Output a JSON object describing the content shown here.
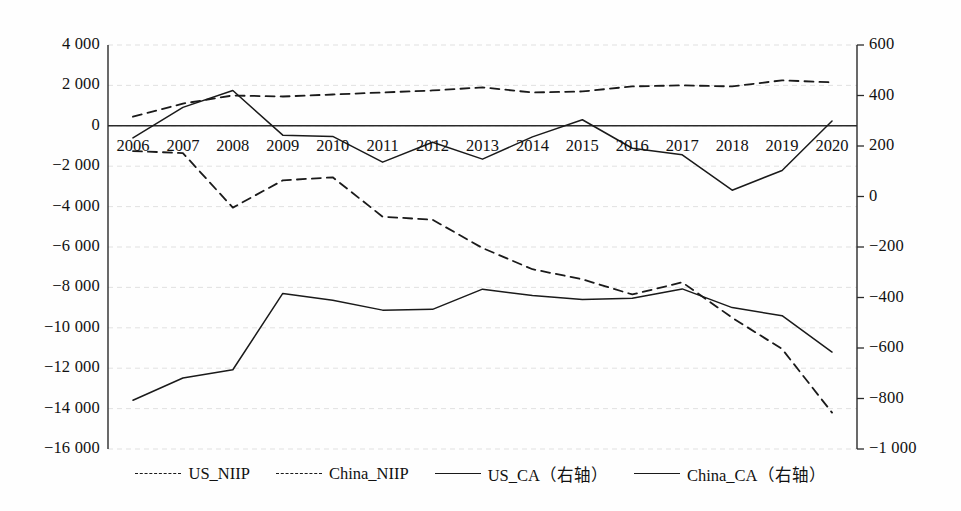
{
  "chart_data": {
    "type": "line",
    "title": "",
    "subtitle": "",
    "xlabel": "",
    "ylabel": "",
    "categories": [
      "2006",
      "2007",
      "2008",
      "2009",
      "2010",
      "2011",
      "2012",
      "2013",
      "2014",
      "2015",
      "2016",
      "2017",
      "2018",
      "2019",
      "2020"
    ],
    "x": [
      2006,
      2007,
      2008,
      2009,
      2010,
      2011,
      2012,
      2013,
      2014,
      2015,
      2016,
      2017,
      2018,
      2019,
      2020
    ],
    "grid": true,
    "legend_position": "bottom",
    "axes": {
      "left": {
        "label": "",
        "ylim": [
          -16000,
          4000
        ],
        "tick_step": 2000,
        "ticks": [
          4000,
          2000,
          0,
          -2000,
          -4000,
          -6000,
          -8000,
          -10000,
          -12000,
          -14000,
          -16000
        ],
        "tick_labels": [
          "4 000",
          "2 000",
          "0",
          "−2 000",
          "−4 000",
          "−6 000",
          "−8 000",
          "−10 000",
          "−12 000",
          "−14 000",
          "−16 000"
        ]
      },
      "right": {
        "label": "右轴",
        "ylim": [
          -1000,
          600
        ],
        "tick_step": 200,
        "ticks": [
          600,
          400,
          200,
          0,
          -200,
          -400,
          -600,
          -800,
          -1000
        ],
        "tick_labels": [
          "600",
          "400",
          "200",
          "0",
          "−200",
          "−400",
          "−600",
          "−800",
          "−1 000"
        ]
      }
    },
    "series": [
      {
        "name": "US_NIIP",
        "axis": "left",
        "style": "dashed",
        "color": "#1a1a1a",
        "values": [
          -1250,
          -1350,
          -4050,
          -2700,
          -2550,
          -4500,
          -4650,
          -6050,
          -7100,
          -7600,
          -8350,
          -7750,
          -9500,
          -11050,
          -14200
        ]
      },
      {
        "name": "China_NIIP",
        "axis": "left",
        "style": "dashed",
        "color": "#1a1a1a",
        "values": [
          450,
          1100,
          1500,
          1450,
          1550,
          1650,
          1750,
          1900,
          1650,
          1700,
          1950,
          2000,
          1950,
          2250,
          2150
        ]
      },
      {
        "name": "US_CA（右轴）",
        "axis": "right",
        "style": "solid",
        "color": "#1a1a1a",
        "values": [
          -807,
          -719,
          -686,
          -384,
          -411,
          -450,
          -447,
          -367,
          -392,
          -408,
          -403,
          -366,
          -440,
          -472,
          -616
        ]
      },
      {
        "name": "China_CA（右轴）",
        "axis": "right",
        "style": "solid",
        "color": "#1a1a1a",
        "values": [
          232,
          353,
          420,
          243,
          238,
          136,
          215,
          148,
          236,
          304,
          191,
          165,
          25,
          103,
          299
        ]
      }
    ]
  },
  "legend": {
    "items": [
      {
        "label": "US_NIIP",
        "style": "dashed"
      },
      {
        "label": "China_NIIP",
        "style": "dashed"
      },
      {
        "label": "US_CA（右轴）",
        "style": "solid"
      },
      {
        "label": "China_CA（右轴）",
        "style": "solid"
      }
    ]
  }
}
